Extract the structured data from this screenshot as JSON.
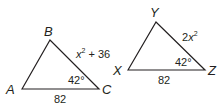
{
  "triangles": [
    {
      "name": "ABC",
      "vertices": {
        "A": "A",
        "B": "B",
        "C": "C"
      },
      "side_BC": "x² + 36",
      "side_AC": "82",
      "angle_C": "42°"
    },
    {
      "name": "XYZ",
      "vertices": {
        "X": "X",
        "Y": "Y",
        "Z": "Z"
      },
      "side_YZ": "2x²",
      "side_XZ": "82",
      "angle_Z": "42°"
    }
  ],
  "colors": {
    "stroke": "#231f20",
    "background": "#ffffff"
  }
}
